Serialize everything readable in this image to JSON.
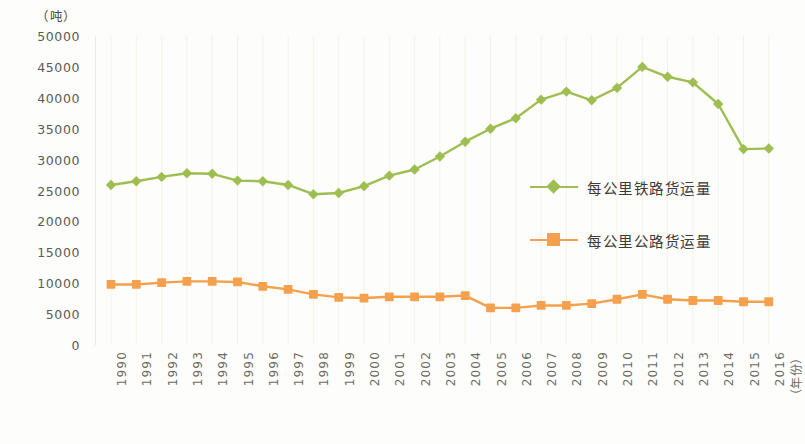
{
  "chart_data": {
    "type": "line",
    "title": "",
    "xlabel": "（年份）",
    "ylabel": "（吨）",
    "ylim": [
      0,
      50000
    ],
    "ytick_step": 5000,
    "yticks": [
      "50000",
      "45000",
      "40000",
      "35000",
      "30000",
      "25000",
      "20000",
      "15000",
      "10000",
      "5000",
      "0"
    ],
    "ytick_values": [
      50000,
      45000,
      40000,
      35000,
      30000,
      25000,
      20000,
      15000,
      10000,
      5000,
      0
    ],
    "grid": "vertical-faint",
    "legend_position": "center-right-inside",
    "categories": [
      "1990",
      "1991",
      "1992",
      "1993",
      "1994",
      "1995",
      "1996",
      "1997",
      "1998",
      "1999",
      "2000",
      "2001",
      "2002",
      "2003",
      "2004",
      "2005",
      "2006",
      "2007",
      "2008",
      "2009",
      "2010",
      "2011",
      "2012",
      "2013",
      "2014",
      "2015",
      "2016"
    ],
    "series": [
      {
        "name": "每公里铁路货运量",
        "color": "#9EBE52",
        "marker": "diamond",
        "values": [
          25900,
          26500,
          27200,
          27800,
          27700,
          26600,
          26500,
          25900,
          24400,
          24600,
          25700,
          27400,
          28400,
          30500,
          32900,
          35000,
          36700,
          39700,
          41000,
          39600,
          41600,
          45000,
          43400,
          42500,
          39000,
          31700,
          31800
        ]
      },
      {
        "name": "每公里公路货运量",
        "color": "#F5A04C",
        "marker": "square",
        "values": [
          9800,
          9800,
          10100,
          10300,
          10300,
          10200,
          9500,
          9000,
          8200,
          7700,
          7600,
          7800,
          7800,
          7800,
          8000,
          6000,
          6000,
          6400,
          6400,
          6700,
          7400,
          8200,
          7400,
          7200,
          7200,
          7000,
          7000
        ]
      }
    ]
  },
  "axes": {
    "y_unit_caption": "（吨）",
    "x_axis_caption": "（年份）"
  },
  "legend": {
    "entries": [
      {
        "label": "每公里铁路货运量",
        "color": "#9EBE52",
        "marker": "diamond"
      },
      {
        "label": "每公里公路货运量",
        "color": "#F5A04C",
        "marker": "square"
      }
    ]
  },
  "colors": {
    "railway": "#9EBE52",
    "highway": "#F5A04C",
    "background": "#fdfdfb",
    "axis_text": "#5a5a57",
    "gridline": "#f4f2e8"
  }
}
